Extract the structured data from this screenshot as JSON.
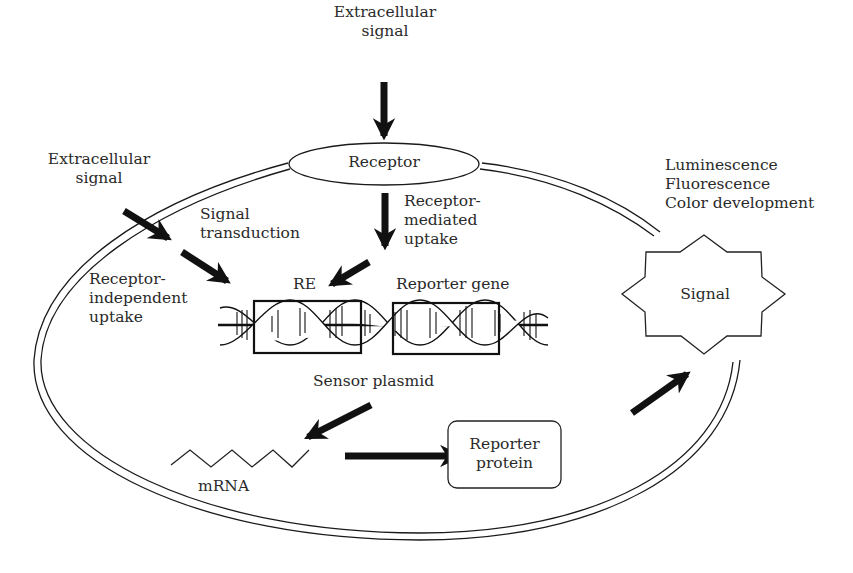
{
  "diagram": {
    "labels": {
      "extracellular_signal_top": "Extracellular\nsignal",
      "extracellular_signal_left": "Extracellular\nsignal",
      "receptor": "Receptor",
      "signal_transduction": "Signal\ntransduction",
      "receptor_mediated_uptake": "Receptor-\nmediated\nuptake",
      "receptor_independent_uptake": "Receptor-\nindependent\nuptake",
      "re": "RE",
      "reporter_gene": "Reporter gene",
      "sensor_plasmid": "Sensor plasmid",
      "mrna": "mRNA",
      "reporter_protein": "Reporter\nprotein",
      "signal": "Signal",
      "outputs": "Luminescence\nFluorescence\nColor development"
    },
    "nodes": [
      {
        "id": "extracellular_signal_top",
        "type": "text"
      },
      {
        "id": "extracellular_signal_left",
        "type": "text"
      },
      {
        "id": "receptor",
        "type": "ellipse"
      },
      {
        "id": "dna_re",
        "type": "boxed-dna-segment"
      },
      {
        "id": "dna_reporter_gene",
        "type": "boxed-dna-segment"
      },
      {
        "id": "mrna",
        "type": "zigzag"
      },
      {
        "id": "reporter_protein",
        "type": "rounded-rect"
      },
      {
        "id": "signal",
        "type": "8-point-star"
      }
    ],
    "edges": [
      {
        "from": "extracellular_signal_top",
        "to": "receptor"
      },
      {
        "from": "receptor",
        "to": "dna_re",
        "label": "Receptor-mediated uptake"
      },
      {
        "from": "extracellular_signal_left",
        "to": "dna_re",
        "label": "Signal transduction / Receptor-independent uptake"
      },
      {
        "from": "sensor_plasmid",
        "to": "mrna"
      },
      {
        "from": "mrna",
        "to": "reporter_protein"
      },
      {
        "from": "reporter_protein",
        "to": "signal"
      }
    ],
    "colors": {
      "stroke": "#1a1a1a",
      "text": "#2a2a2a",
      "background": "#ffffff"
    }
  }
}
